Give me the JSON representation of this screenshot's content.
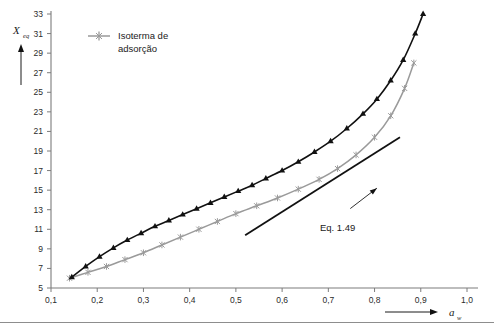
{
  "chart_data": {
    "type": "line",
    "title": "",
    "xlabel": "a_w",
    "ylabel": "X_eq",
    "xlim": [
      0.1,
      1.0
    ],
    "ylim": [
      5,
      33
    ],
    "xticks": [
      0.1,
      0.2,
      0.3,
      0.4,
      0.5,
      0.6,
      0.7,
      0.8,
      0.9,
      1.0
    ],
    "xtick_labels": [
      "0,1",
      "0,2",
      "0,3",
      "0,4",
      "0,5",
      "0,6",
      "0,7",
      "0,8",
      "0,9",
      "1,0"
    ],
    "yticks": [
      5,
      7,
      9,
      11,
      13,
      15,
      17,
      19,
      21,
      23,
      25,
      27,
      29,
      31,
      33
    ],
    "ytick_labels": [
      "5",
      "7",
      "9",
      "11",
      "13",
      "15",
      "17",
      "19",
      "21",
      "23",
      "25",
      "27",
      "29",
      "31",
      "33"
    ],
    "grid": false,
    "legend_position": "top-left",
    "series": [
      {
        "name": "Isoterma de adsorção",
        "color": "#9a9a9a",
        "marker": "cross",
        "in_legend": true,
        "x": [
          0.14,
          0.18,
          0.22,
          0.26,
          0.3,
          0.34,
          0.38,
          0.42,
          0.46,
          0.5,
          0.545,
          0.59,
          0.635,
          0.68,
          0.72,
          0.76,
          0.8,
          0.835,
          0.865,
          0.885
        ],
        "y": [
          6.0,
          6.6,
          7.2,
          7.9,
          8.6,
          9.4,
          10.2,
          11.0,
          11.8,
          12.6,
          13.4,
          14.2,
          15.1,
          16.1,
          17.2,
          18.6,
          20.4,
          22.6,
          25.4,
          28.0
        ]
      },
      {
        "name": "Modelo",
        "color": "#111111",
        "marker": "triangle",
        "in_legend": false,
        "x": [
          0.145,
          0.175,
          0.205,
          0.235,
          0.265,
          0.295,
          0.325,
          0.355,
          0.385,
          0.415,
          0.445,
          0.475,
          0.505,
          0.535,
          0.565,
          0.6,
          0.635,
          0.67,
          0.705,
          0.74,
          0.775,
          0.805,
          0.835,
          0.862,
          0.888,
          0.905
        ],
        "y": [
          6.1,
          7.2,
          8.2,
          9.1,
          9.9,
          10.6,
          11.3,
          11.9,
          12.5,
          13.1,
          13.7,
          14.3,
          14.9,
          15.5,
          16.2,
          17.0,
          17.9,
          18.9,
          20.0,
          21.3,
          22.8,
          24.3,
          26.2,
          28.3,
          31.0,
          33.0
        ]
      },
      {
        "name": "Eq. 1.49",
        "color": "#111111",
        "marker": "none",
        "in_legend": false,
        "x": [
          0.52,
          0.855
        ],
        "y": [
          10.4,
          20.4
        ]
      }
    ],
    "annotations": [
      {
        "text": "Eq. 1.49",
        "x": 0.72,
        "y": 11.2,
        "arrow_to_x": 0.805,
        "arrow_to_y": 15.2
      }
    ]
  },
  "legend": {
    "entries": [
      {
        "line1": "Isoterma de",
        "line2": "adsorção"
      }
    ]
  },
  "axes": {
    "y_title": "X",
    "y_subscript": "eq",
    "x_title": "a",
    "x_subscript": "w"
  }
}
